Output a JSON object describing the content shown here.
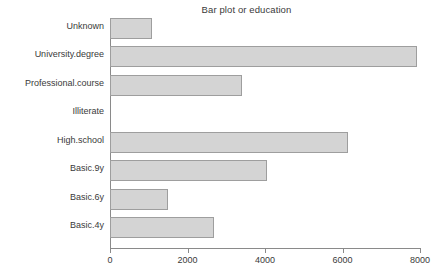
{
  "chart_data": {
    "type": "bar",
    "orientation": "horizontal",
    "title": "Bar plot or education",
    "xlabel": "",
    "ylabel": "",
    "categories": [
      "Basic.4y",
      "Basic.6y",
      "Basic.9y",
      "High.school",
      "Illiterate",
      "Professional.course",
      "University.degree",
      "Unknown"
    ],
    "values": [
      2684,
      1497,
      4052,
      6142,
      0,
      3406,
      7920,
      1084
    ],
    "xlim": [
      0,
      8000
    ],
    "xticks": [
      0,
      2000,
      4000,
      6000,
      8000
    ],
    "xtick_labels": [
      "0",
      "2000",
      "4000",
      "6000",
      "8000"
    ],
    "grid": false,
    "legend": null,
    "bar_fill_color": "#d4d4d4",
    "bar_border_color": "#9e9e9e",
    "axis_color": "#8a8a8a",
    "display_order_top_to_bottom": [
      "Unknown",
      "University.degree",
      "Professional.course",
      "Illiterate",
      "High.school",
      "Basic.9y",
      "Basic.6y",
      "Basic.4y"
    ]
  }
}
